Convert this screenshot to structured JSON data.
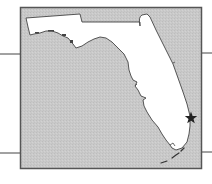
{
  "map": {
    "region": "Florida",
    "style": "locator map",
    "colors": {
      "water": "#c9c9c9",
      "land": "#ffffff",
      "border": "#555555",
      "coastline": "#444444",
      "marker": "#222222",
      "leader_lines": "#444444"
    },
    "frame": {
      "x": 20,
      "y": 7,
      "width": 181,
      "height": 161
    },
    "leader_lines": [
      {
        "side": "left",
        "y": 54
      },
      {
        "side": "left",
        "y": 153
      },
      {
        "side": "right",
        "y": 53
      },
      {
        "side": "right",
        "y": 152
      }
    ],
    "marker": {
      "icon": "star-icon",
      "x": 191,
      "y": 118,
      "description": "Location marker on southeast Atlantic coast"
    }
  }
}
